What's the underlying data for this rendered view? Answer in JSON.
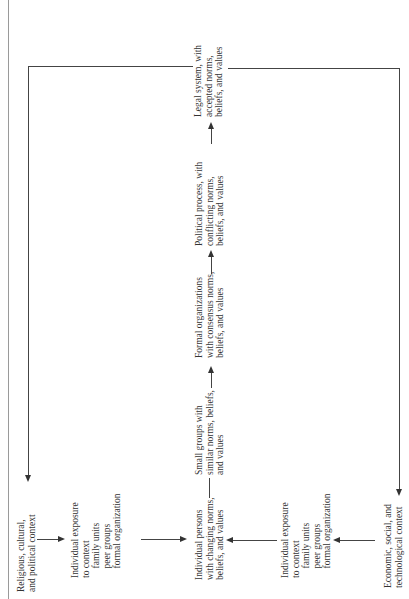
{
  "diagram": {
    "orientation": "rotated 90 degrees counter-clockwise",
    "nodes": {
      "religious_context": "Religious, cultural,\nand political context",
      "exposure_top": "Individual exposure\nto context\n    family units\n    peer groups\n    formal organization",
      "individual_persons": "Individual persons\nwith changing norms,\nbeliefs, and values",
      "exposure_bottom": "Individual exposure\nto context\n    family units\n    peer groups\n    formal organization",
      "economic_context": "Economic, social, and\ntechnological context",
      "small_groups": "Small groups with\nsimilar norms, beliefs,\nand values",
      "formal_organizations": "Formal organizations\nwith consensus norms,\nbeliefs, and values",
      "political_process": "Political process, with\nconflicting norms,\nbeliefs, and values",
      "legal_system": "Legal system, with\naccepted norms,\nbeliefs, and values"
    },
    "edges": [
      {
        "from": "religious_context",
        "to": "exposure_top"
      },
      {
        "from": "exposure_top",
        "to": "individual_persons"
      },
      {
        "from": "economic_context",
        "to": "exposure_bottom"
      },
      {
        "from": "exposure_bottom",
        "to": "individual_persons"
      },
      {
        "from": "individual_persons",
        "to": "small_groups"
      },
      {
        "from": "small_groups",
        "to": "formal_organizations"
      },
      {
        "from": "formal_organizations",
        "to": "political_process"
      },
      {
        "from": "political_process",
        "to": "legal_system"
      },
      {
        "from": "legal_system",
        "to": "religious_context"
      },
      {
        "from": "legal_system",
        "to": "economic_context"
      }
    ]
  }
}
